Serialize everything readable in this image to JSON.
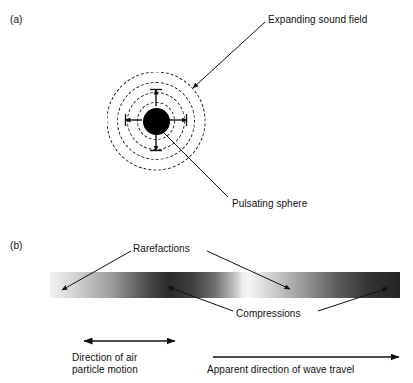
{
  "figure": {
    "panels": [
      {
        "tag": "(a)",
        "labels": {
          "expanding_sound_field": "Expanding sound field",
          "pulsating_sphere": "Pulsating sphere"
        },
        "elements": {
          "sphere_color": "#000000",
          "ring_count": 4,
          "ring_style": "dashed",
          "radial_arrow_count": 4
        }
      },
      {
        "tag": "(b)",
        "labels": {
          "rarefactions": "Rarefactions",
          "compressions": "Compressions",
          "particle_motion": "Direction of air\nparticle motion",
          "wave_travel": "Apparent direction of wave travel"
        },
        "elements": {
          "bar_description": "horizontal greyscale band alternating light rarefactions and dark compressions",
          "particle_motion_arrow": "double-headed horizontal arrow",
          "wave_travel_arrow": "single-headed arrow pointing right"
        }
      }
    ],
    "colors": {
      "ink": "#111111",
      "sphere": "#000000",
      "background": "#ffffff"
    }
  }
}
